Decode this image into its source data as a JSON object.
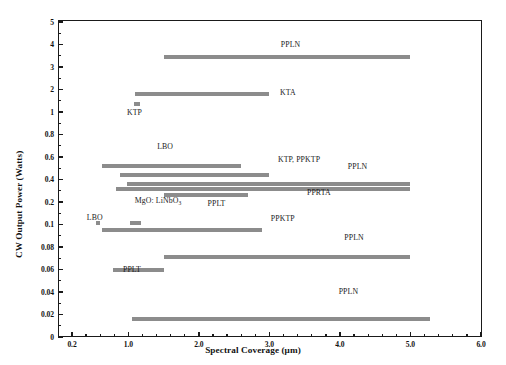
{
  "chart_data": {
    "type": "bar",
    "orientation": "horizontal-range",
    "title": "",
    "xlabel": "Spectral Coverage (μm)",
    "ylabel": "CW Output Power (Watts)",
    "grid": false,
    "legend": "none",
    "xlim": [
      0.0,
      6.0
    ],
    "x_scale": "linear",
    "x_ticks": [
      0.2,
      1.0,
      2.0,
      3.0,
      4.0,
      5.0,
      6.0
    ],
    "x_tick_labels": [
      "0.2",
      "1.0",
      "2.0",
      "3.0",
      "4.0",
      "5.0",
      "6.0"
    ],
    "y_scale": "piecewise-even",
    "y_ticks": [
      5,
      4,
      3,
      2,
      1,
      0.8,
      0.6,
      0.4,
      0.2,
      0.1,
      0.08,
      0.06,
      0.04,
      0.02,
      0
    ],
    "y_tick_labels": [
      "5",
      "4",
      "3",
      "2",
      "1",
      "0.8",
      "0.6",
      "0.4",
      "0.2",
      "0.1",
      "0.08",
      "0.06",
      "0.04",
      "0.02",
      "0"
    ],
    "bars": [
      {
        "label": "PPLN",
        "y": 3.45,
        "x_start": 1.5,
        "x_end": 5.0,
        "label_x": 3.3,
        "label_y_px": 40,
        "label_align": "center"
      },
      {
        "label": "KTA",
        "y": 1.8,
        "x_start": 1.1,
        "x_end": 3.0,
        "label_x": 3.15,
        "label_y_px": 88,
        "label_align": "left"
      },
      {
        "label": "KTP",
        "y": 1.35,
        "x_start": 1.08,
        "x_end": 1.16,
        "label_x": 0.98,
        "label_y_px": 108,
        "label_align": "left"
      },
      {
        "label": "LBO",
        "y": 0.52,
        "x_start": 0.62,
        "x_end": 2.6,
        "label_x": 1.52,
        "label_y_px": 142,
        "label_align": "center"
      },
      {
        "label": "KTP, PPKTP",
        "y": 0.44,
        "x_start": 0.88,
        "x_end": 3.0,
        "label_x": 3.12,
        "label_y_px": 155,
        "label_align": "left"
      },
      {
        "label": "PPLN",
        "y": 0.36,
        "x_start": 0.98,
        "x_end": 5.0,
        "label_x": 4.25,
        "label_y_px": 162,
        "label_align": "center"
      },
      {
        "label": "PPRTA",
        "y": 0.32,
        "x_start": 0.82,
        "x_end": 5.0,
        "label_x": 3.7,
        "label_y_px": 188,
        "label_align": "center"
      },
      {
        "label": "PPLT",
        "y": 0.26,
        "x_start": 1.5,
        "x_end": 2.7,
        "label_x": 2.25,
        "label_y_px": 199,
        "label_align": "center"
      },
      {
        "label": "MgO: LiNbO3",
        "y": 0.105,
        "x_start": 1.02,
        "x_end": 1.18,
        "label_x": 1.42,
        "label_y_px": 196,
        "label_align": "center",
        "sub": "3"
      },
      {
        "label": "LBO",
        "y": 0.105,
        "x_start": 0.54,
        "x_end": 0.6,
        "label_x": 0.41,
        "label_y_px": 213,
        "label_align": "left"
      },
      {
        "label": "PPKTP",
        "y": 0.095,
        "x_start": 0.62,
        "x_end": 2.9,
        "label_x": 3.02,
        "label_y_px": 214,
        "label_align": "left"
      },
      {
        "label": "PPLN",
        "y": 0.071,
        "x_start": 1.5,
        "x_end": 5.0,
        "label_x": 4.2,
        "label_y_px": 233,
        "label_align": "center"
      },
      {
        "label": "PPLT",
        "y": 0.06,
        "x_start": 0.78,
        "x_end": 1.5,
        "label_x": 1.05,
        "label_y_px": 265,
        "label_align": "center"
      },
      {
        "label": "PPLN",
        "y": 0.016,
        "x_start": 1.05,
        "x_end": 5.28,
        "label_x": 4.12,
        "label_y_px": 287,
        "label_align": "center"
      }
    ]
  },
  "axes": {
    "x_title": "Spectral Coverage (μm)",
    "y_title": "CW Output Power (Watts)"
  }
}
